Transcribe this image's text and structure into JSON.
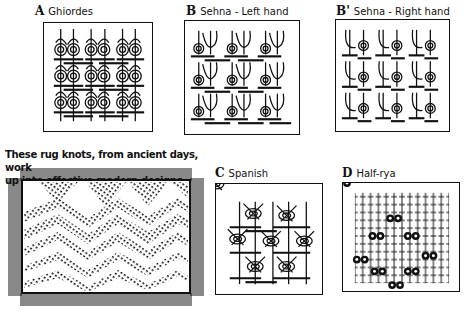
{
  "panels": [
    {
      "id": "A",
      "letter": "A",
      "name": "Ghiordes",
      "rows": 3,
      "cols": 3
    },
    {
      "id": "B",
      "letter": "B",
      "name": "Sehna - Left hand",
      "rows": 3,
      "cols": 3
    },
    {
      "id": "B-prime",
      "letter": "B'",
      "name": "Sehna - Right hand",
      "rows": 3,
      "cols": 3
    },
    {
      "id": "C",
      "letter": "C",
      "name": "Spanish",
      "knots": 7
    },
    {
      "id": "D",
      "letter": "D",
      "name": "Half-rya",
      "knots": 8
    }
  ],
  "caption": {
    "line1": "These rug knots, from ancient days, work",
    "line2": "up into effective modern designs."
  },
  "rug": {
    "description": "fringed rug with zigzag chevron knot pattern",
    "chevron_rows": 5
  },
  "colors": {
    "ink": "#111111",
    "paper": "#ffffff"
  }
}
